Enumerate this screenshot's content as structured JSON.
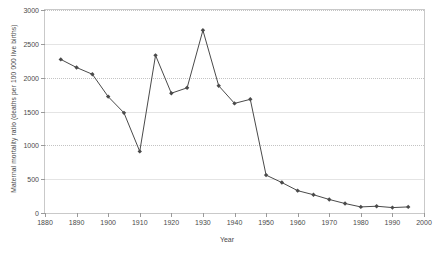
{
  "chart_data": {
    "type": "line",
    "title": "",
    "xlabel": "Year",
    "ylabel": "Maternal mortality ratio (deaths per 100 000 live births)",
    "xlim": [
      1880,
      2000
    ],
    "ylim": [
      0,
      3000
    ],
    "xticks": [
      1880,
      1890,
      1900,
      1910,
      1920,
      1930,
      1940,
      1950,
      1960,
      1970,
      1980,
      1990,
      2000
    ],
    "yticks": [
      0,
      500,
      1000,
      1500,
      2000,
      2500,
      3000
    ],
    "xtick_labels": [
      "1880",
      "1890",
      "1900",
      "1910",
      "1920",
      "1930",
      "1940",
      "1950",
      "1960",
      "1970",
      "1980",
      "1990",
      "2000"
    ],
    "ytick_labels": [
      "0",
      "500",
      "1000",
      "1500",
      "2000",
      "2500",
      "3000"
    ],
    "grid": true,
    "legend": false,
    "marker": "diamond",
    "series_color": "#4a4a4a",
    "x": [
      1885,
      1890,
      1895,
      1900,
      1905,
      1910,
      1915,
      1920,
      1925,
      1930,
      1935,
      1940,
      1945,
      1950,
      1955,
      1960,
      1965,
      1970,
      1975,
      1980,
      1985,
      1990,
      1995
    ],
    "values": [
      2270,
      2150,
      2050,
      1720,
      1480,
      910,
      2330,
      1770,
      1850,
      2700,
      1880,
      1620,
      1680,
      560,
      450,
      330,
      270,
      200,
      140,
      90,
      100,
      80,
      90
    ],
    "series": [
      {
        "name": "Maternal mortality ratio",
        "values": [
          2270,
          2150,
          2050,
          1720,
          1480,
          910,
          2330,
          1770,
          1850,
          2700,
          1880,
          1620,
          1680,
          560,
          450,
          330,
          270,
          200,
          140,
          90,
          100,
          80,
          90
        ]
      }
    ]
  },
  "colors": {
    "series": "#4a4a4a",
    "grid": "#c3c3c3",
    "frame": "#c9c9c9",
    "text": "#4a4a4a",
    "background": "#ffffff"
  }
}
